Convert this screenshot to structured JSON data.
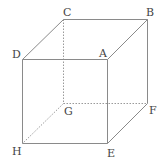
{
  "diagram": {
    "type": "cube",
    "vertices": {
      "A": {
        "x": 107,
        "y": 59,
        "label": "A",
        "lx": 99,
        "ly": 57
      },
      "B": {
        "x": 147,
        "y": 19,
        "label": "B",
        "lx": 146,
        "ly": 16
      },
      "C": {
        "x": 63,
        "y": 19,
        "label": "C",
        "lx": 63,
        "ly": 16
      },
      "D": {
        "x": 22,
        "y": 59,
        "label": "D",
        "lx": 12,
        "ly": 58
      },
      "E": {
        "x": 107,
        "y": 143,
        "label": "E",
        "lx": 107,
        "ly": 157
      },
      "F": {
        "x": 147,
        "y": 103,
        "label": "F",
        "lx": 149,
        "ly": 114
      },
      "G": {
        "x": 63,
        "y": 103,
        "label": "G",
        "lx": 64,
        "ly": 115
      },
      "H": {
        "x": 22,
        "y": 143,
        "label": "H",
        "lx": 12,
        "ly": 155
      }
    },
    "visible_edges": [
      [
        "D",
        "A"
      ],
      [
        "A",
        "B"
      ],
      [
        "B",
        "C"
      ],
      [
        "C",
        "D"
      ],
      [
        "D",
        "H"
      ],
      [
        "H",
        "E"
      ],
      [
        "E",
        "A"
      ],
      [
        "E",
        "F"
      ],
      [
        "F",
        "B"
      ]
    ],
    "hidden_edges": [
      [
        "C",
        "G"
      ],
      [
        "G",
        "F"
      ],
      [
        "G",
        "H"
      ]
    ]
  }
}
